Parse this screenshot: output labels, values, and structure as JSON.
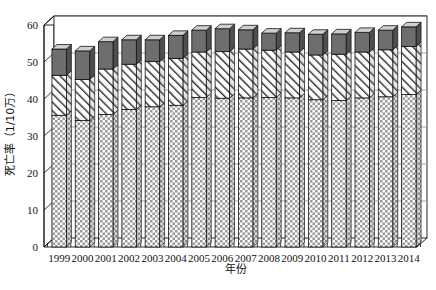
{
  "chart_data": {
    "type": "bar",
    "subtype": "stacked-column-3d",
    "title": "",
    "xlabel": "年份",
    "ylabel": "死亡率（1/10万）",
    "ylim": [
      0,
      60
    ],
    "yticks": [
      0,
      10,
      20,
      30,
      40,
      50,
      60
    ],
    "grid": true,
    "grid_axis": "y",
    "legend": "none",
    "categories": [
      "1999",
      "2000",
      "2001",
      "2002",
      "2003",
      "2004",
      "2005",
      "2006",
      "2007",
      "2008",
      "2009",
      "2010",
      "2011",
      "2012",
      "2013",
      "2014"
    ],
    "series": [
      {
        "name": "底层（交叉网格填充）",
        "pattern": "checkerboard",
        "color": "#d9d9d9",
        "values": [
          35.6,
          34.2,
          35.8,
          37.2,
          37.9,
          38.3,
          40.4,
          40.2,
          40.3,
          40.4,
          40.3,
          39.8,
          39.6,
          40.3,
          40.6,
          41.2
        ]
      },
      {
        "name": "中层（斜线填充）",
        "pattern": "diagonal-hatch",
        "color": "#ffffff",
        "values": [
          10.8,
          11.1,
          12.3,
          12.2,
          12.2,
          12.7,
          12.3,
          12.6,
          13.2,
          12.8,
          12.4,
          12.1,
          12.5,
          12.4,
          12.7,
          13.0
        ]
      },
      {
        "name": "顶层（深灰实心）",
        "pattern": "solid",
        "color": "#6e6e6e",
        "values": [
          7.1,
          7.7,
          7.4,
          6.6,
          5.9,
          6.2,
          5.9,
          6.2,
          5.2,
          4.6,
          5.2,
          5.6,
          5.5,
          5.3,
          5.3,
          5.3
        ]
      }
    ],
    "totals": [
      53.5,
      53.0,
      55.5,
      56.0,
      56.0,
      57.2,
      58.6,
      59.0,
      58.7,
      57.8,
      57.9,
      57.5,
      57.6,
      58.0,
      58.6,
      59.5
    ],
    "tick_labels_y": [
      "0",
      "10",
      "20",
      "30",
      "40",
      "50",
      "60"
    ]
  },
  "axes": {
    "y_title": "死亡率（1/10万）",
    "x_title": "年份"
  }
}
